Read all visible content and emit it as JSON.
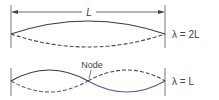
{
  "dimension_label": "L",
  "top_wave": {
    "label": "λ = 2L",
    "mode": "fundamental"
  },
  "bottom_wave": {
    "label": "λ = L",
    "node_label": "Node",
    "mode": "second harmonic"
  },
  "colors": {
    "line": "#3a3a3a",
    "dashed": "#4a4a4a",
    "accent": "#5a5a9a"
  }
}
